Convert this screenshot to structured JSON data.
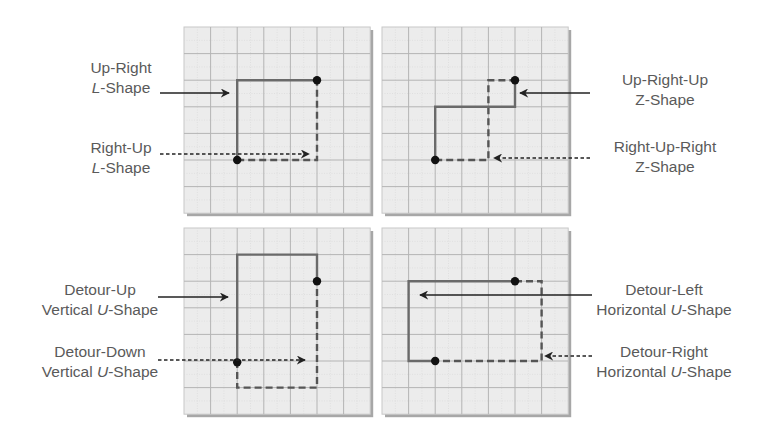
{
  "diagram": {
    "grid": {
      "cols": 7,
      "rows": 7,
      "cell": 26.6,
      "background": "#ececec",
      "major_line": "#b4b4b4",
      "minor_line": "#d6d6d6",
      "shadow": "#8a8a8a"
    },
    "colors": {
      "path": "#6a6a6a",
      "dashed_path": "#555555",
      "dot": "#111111",
      "text": "#5a5a5a",
      "arrow": "#222222"
    },
    "panels": [
      {
        "id": "up-right-l",
        "origin": [
          184,
          27
        ],
        "solid_path": [
          [
            2,
            5
          ],
          [
            2,
            2
          ],
          [
            5,
            2
          ]
        ],
        "solid_path_tail": [
          [
            5,
            2
          ],
          [
            5,
            2
          ]
        ],
        "dashed_path": [
          [
            2,
            5
          ],
          [
            5,
            5
          ],
          [
            5,
            2
          ]
        ],
        "dots": [
          [
            2,
            5
          ],
          [
            5,
            2
          ]
        ],
        "labels": [
          {
            "line1": "Up-Right",
            "line2_italic": "L",
            "line2_rest": "-Shape",
            "arrow": "solid",
            "arrow_y": 93,
            "arrow_from": 160,
            "arrow_to": 229
          },
          {
            "line1": "Right-Up",
            "line2_italic": "L",
            "line2_rest": "-Shape",
            "arrow": "dashed",
            "arrow_y": 154,
            "arrow_from": 160,
            "arrow_to": 309
          }
        ]
      },
      {
        "id": "up-right-up-z",
        "origin": [
          382,
          27
        ],
        "solid_path": [
          [
            2,
            5
          ],
          [
            2,
            3
          ],
          [
            5,
            3
          ],
          [
            5,
            2
          ]
        ],
        "dashed_path": [
          [
            2,
            5
          ],
          [
            4,
            5
          ],
          [
            4,
            2
          ],
          [
            5,
            2
          ]
        ],
        "dots": [
          [
            2,
            5
          ],
          [
            5,
            2
          ]
        ],
        "labels": [
          {
            "line1": "Up-Right-Up",
            "line2_italic": "",
            "line2_rest": "Z-Shape",
            "arrow": "solid",
            "arrow_y": 93,
            "arrow_from": 590,
            "arrow_to": 520
          },
          {
            "line1": "Right-Up-Right",
            "line2_italic": "",
            "line2_rest": "Z-Shape",
            "arrow": "dashed",
            "arrow_y": 158,
            "arrow_from": 590,
            "arrow_to": 494
          }
        ]
      },
      {
        "id": "vertical-u",
        "origin": [
          184,
          228
        ],
        "solid_path": [
          [
            2,
            5
          ],
          [
            2,
            1
          ],
          [
            5,
            1
          ],
          [
            5,
            2
          ]
        ],
        "dashed_path": [
          [
            2,
            5
          ],
          [
            2,
            6
          ],
          [
            5,
            6
          ],
          [
            5,
            2
          ]
        ],
        "dots": [
          [
            2,
            5.05
          ],
          [
            5,
            2
          ]
        ],
        "labels": [
          {
            "line1": "Detour-Up",
            "line2_italic": "U",
            "line2_rest": "-Shape",
            "line2_prefix": "Vertical ",
            "arrow": "solid",
            "arrow_y": 297,
            "arrow_from": 158,
            "arrow_to": 228
          },
          {
            "line1": "Detour-Down",
            "line2_italic": "U",
            "line2_rest": "-Shape",
            "line2_prefix": "Vertical ",
            "arrow": "dashed",
            "arrow_y": 360,
            "arrow_from": 158,
            "arrow_to": 305
          }
        ]
      },
      {
        "id": "horizontal-u",
        "origin": [
          382,
          228
        ],
        "solid_path": [
          [
            5,
            2
          ],
          [
            1,
            2
          ],
          [
            1,
            5
          ],
          [
            2,
            5
          ]
        ],
        "dashed_path": [
          [
            5,
            2
          ],
          [
            6,
            2
          ],
          [
            6,
            5
          ],
          [
            2,
            5
          ]
        ],
        "dots": [
          [
            2,
            5
          ],
          [
            5,
            2
          ]
        ],
        "labels": [
          {
            "line1": "Detour-Left",
            "line2_italic": "U",
            "line2_rest": "-Shape",
            "line2_prefix": "Horizontal ",
            "arrow": "solid",
            "arrow_y": 295,
            "arrow_from": 592,
            "arrow_to": 420
          },
          {
            "line1": "Detour-Right",
            "line2_italic": "U",
            "line2_rest": "-Shape",
            "line2_prefix": "Horizontal ",
            "arrow": "dashed",
            "arrow_y": 356,
            "arrow_from": 592,
            "arrow_to": 545
          }
        ]
      }
    ]
  },
  "text": {
    "tl_solid_1": "Up-Right",
    "tl_solid_2i": "L",
    "tl_solid_2r": "-Shape",
    "tl_dash_1": "Right-Up",
    "tl_dash_2i": "L",
    "tl_dash_2r": "-Shape",
    "tr_solid_1": "Up-Right-Up",
    "tr_solid_2": "Z-Shape",
    "tr_dash_1": "Right-Up-Right",
    "tr_dash_2": "Z-Shape",
    "bl_solid_1": "Detour-Up",
    "bl_solid_2p": "Vertical ",
    "bl_solid_2i": "U",
    "bl_solid_2r": "-Shape",
    "bl_dash_1": "Detour-Down",
    "bl_dash_2p": "Vertical ",
    "bl_dash_2i": "U",
    "bl_dash_2r": "-Shape",
    "br_solid_1": "Detour-Left",
    "br_solid_2p": "Horizontal ",
    "br_solid_2i": "U",
    "br_solid_2r": "-Shape",
    "br_dash_1": "Detour-Right",
    "br_dash_2p": "Horizontal ",
    "br_dash_2i": "U",
    "br_dash_2r": "-Shape"
  }
}
